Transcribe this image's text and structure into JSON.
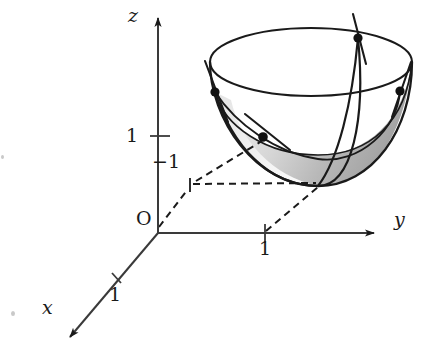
{
  "figure": {
    "type": "3d-coordinate-diagram",
    "width": 425,
    "height": 360,
    "background_color": "#ffffff",
    "ink_color": "#1a1a1a"
  },
  "axes": {
    "origin": {
      "label": "O",
      "x": 158,
      "y": 228
    },
    "x_axis": {
      "label": "x",
      "label_x": 44,
      "label_y": 310,
      "direction": "down-left",
      "arrow": true,
      "from_x": 158,
      "from_y": 228,
      "to_x": 66,
      "to_y": 340,
      "ticks": [
        {
          "label": "1",
          "x": 117,
          "y": 278,
          "label_x": 110,
          "label_y": 288
        }
      ]
    },
    "y_axis": {
      "label": "y",
      "label_x": 396,
      "label_y": 220,
      "direction": "right",
      "arrow": true,
      "from_x": 158,
      "from_y": 233,
      "to_x": 378,
      "to_y": 233,
      "ticks": [
        {
          "label": "1",
          "x": 265,
          "y": 233,
          "label_x": 259,
          "label_y": 240
        }
      ]
    },
    "z_axis": {
      "label": "z",
      "label_x": 128,
      "label_y": 12,
      "direction": "up",
      "arrow": true,
      "from_x": 158,
      "from_y": 233,
      "to_x": 158,
      "to_y": 14,
      "ticks": [
        {
          "label": "1",
          "x": 158,
          "y": 136,
          "label_x": 128,
          "label_y": 127
        }
      ]
    }
  },
  "construction": {
    "minus_one_label": {
      "text": "−1",
      "label_x": 155,
      "label_y": 157,
      "point_x": 190,
      "point_y": 186
    },
    "dashed_lines": [
      {
        "name": "origin-to-minus-one",
        "x1": 158,
        "y1": 228,
        "x2": 190,
        "y2": 186
      },
      {
        "name": "minus-one-to-vertex",
        "x1": 190,
        "y1": 186,
        "x2": 318,
        "y2": 184
      },
      {
        "name": "origin-to-vertex-diagonal",
        "x1": 190,
        "y1": 186,
        "x2": 318,
        "y2": 184
      },
      {
        "name": "y-one-to-vertex",
        "x1": 265,
        "y1": 233,
        "x2": 318,
        "y2": 184
      },
      {
        "name": "vertex-drop",
        "x1": 318,
        "y1": 184,
        "x2": 318,
        "y2": 196
      }
    ]
  },
  "surface": {
    "name": "elliptic-paraboloid",
    "rim": {
      "center_x": 311,
      "center_y": 62,
      "radius_x": 101,
      "radius_y": 34
    },
    "bowl_bottom_x": 318,
    "bowl_bottom_y": 186,
    "shading": {
      "fill_light": "#f2f2f2",
      "fill_mid": "#cfcfcf",
      "fill_dark": "#a8a8a8"
    }
  },
  "points": [
    {
      "name": "point-rim-left",
      "x": 215,
      "y": 92,
      "tangent_x1": 205,
      "tangent_y1": 61,
      "tangent_x2": 228,
      "tangent_y2": 122
    },
    {
      "name": "point-rim-top",
      "x": 358,
      "y": 38,
      "tangent_x1": 353,
      "tangent_y1": 14,
      "tangent_x2": 366,
      "tangent_y2": 64
    },
    {
      "name": "point-rim-right",
      "x": 400,
      "y": 91,
      "tangent_x1": 411,
      "tangent_y1": 62,
      "tangent_x2": 392,
      "tangent_y2": 117
    },
    {
      "name": "point-interior",
      "x": 263,
      "y": 137,
      "tangent_x1": 245,
      "tangent_y1": 114,
      "tangent_x2": 290,
      "tangent_y2": 150
    }
  ],
  "artifacts": [
    {
      "name": "scan-speck-left",
      "x": 12,
      "y": 312,
      "size": 4
    },
    {
      "name": "scan-speck-margin",
      "x": 2,
      "y": 156,
      "size": 3
    }
  ]
}
